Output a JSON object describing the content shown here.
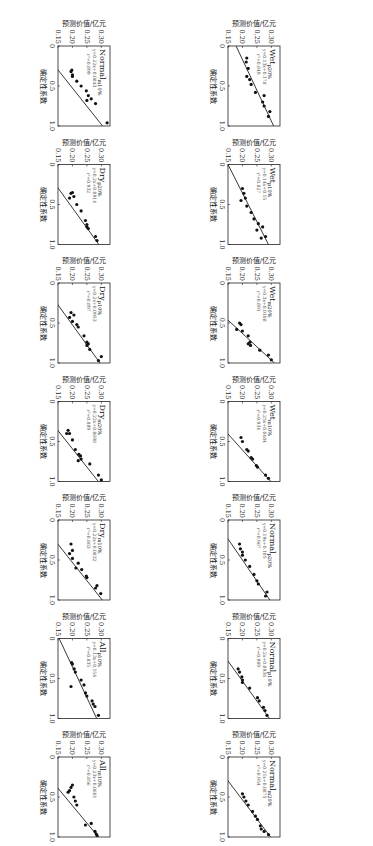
{
  "figure": {
    "xlabel": "确定性系数",
    "ylabel": "预测价值/亿元",
    "xticks": [
      "0",
      "0.5",
      "1.0"
    ],
    "yticks": [
      "0.15",
      "0.20",
      "0.25",
      "0.30"
    ]
  },
  "chart_data": [
    {
      "type": "scatter",
      "title": "Normal",
      "sub": "m10%",
      "equation": "y=0.22x+0.0843",
      "r2": "r²=0.899",
      "slope": 0.22,
      "intercept": 0.0843,
      "points": [
        [
          0.96,
          0.32
        ],
        [
          0.72,
          0.28
        ],
        [
          0.66,
          0.265
        ],
        [
          0.62,
          0.255
        ],
        [
          0.68,
          0.25
        ],
        [
          0.56,
          0.248
        ],
        [
          0.5,
          0.23
        ],
        [
          0.44,
          0.215
        ],
        [
          0.38,
          0.2
        ],
        [
          0.36,
          0.2
        ],
        [
          0.3,
          0.198
        ],
        [
          0.32,
          0.195
        ]
      ],
      "xlabel": "确定性系数",
      "ylabel": "预测价值/亿元",
      "xlim": [
        0,
        1
      ],
      "ylim": [
        0.15,
        0.33
      ]
    },
    {
      "type": "scatter",
      "title": "Dry",
      "sub": "p20%",
      "equation": "y=0.2x+0.0914",
      "r2": "r²=0.932",
      "slope": 0.2,
      "intercept": 0.0914,
      "points": [
        [
          0.95,
          0.285
        ],
        [
          0.9,
          0.28
        ],
        [
          0.8,
          0.255
        ],
        [
          0.75,
          0.25
        ],
        [
          0.78,
          0.25
        ],
        [
          0.7,
          0.245
        ],
        [
          0.58,
          0.23
        ],
        [
          0.5,
          0.215
        ],
        [
          0.4,
          0.205
        ],
        [
          0.35,
          0.2
        ],
        [
          0.36,
          0.195
        ],
        [
          0.42,
          0.19
        ]
      ],
      "xlabel": "确定性系数",
      "ylabel": "预测价值/亿元",
      "xlim": [
        0,
        1
      ],
      "ylim": [
        0.15,
        0.33
      ]
    },
    {
      "type": "scatter",
      "title": "Dry",
      "sub": "p10%",
      "equation": "y=0.2x+0.0953",
      "r2": "r²=0.897",
      "slope": 0.2,
      "intercept": 0.0953,
      "points": [
        [
          0.92,
          0.3
        ],
        [
          0.97,
          0.29
        ],
        [
          0.83,
          0.26
        ],
        [
          0.76,
          0.255
        ],
        [
          0.78,
          0.25
        ],
        [
          0.74,
          0.25
        ],
        [
          0.66,
          0.24
        ],
        [
          0.55,
          0.22
        ],
        [
          0.52,
          0.215
        ],
        [
          0.48,
          0.2
        ],
        [
          0.4,
          0.205
        ],
        [
          0.43,
          0.19
        ],
        [
          0.37,
          0.195
        ]
      ],
      "xlabel": "确定性系数",
      "ylabel": "预测价值/亿元",
      "xlim": [
        0,
        1
      ],
      "ylim": [
        0.15,
        0.33
      ]
    },
    {
      "type": "scatter",
      "title": "Dry",
      "sub": "m20%",
      "equation": "y=0.22x+0.0698",
      "r2": "r²=0.889",
      "slope": 0.22,
      "intercept": 0.0698,
      "points": [
        [
          0.98,
          0.3
        ],
        [
          0.92,
          0.29
        ],
        [
          0.78,
          0.26
        ],
        [
          0.72,
          0.23
        ],
        [
          0.68,
          0.228
        ],
        [
          0.66,
          0.222
        ],
        [
          0.74,
          0.22
        ],
        [
          0.6,
          0.21
        ],
        [
          0.48,
          0.2
        ],
        [
          0.4,
          0.19
        ],
        [
          0.36,
          0.185
        ],
        [
          0.4,
          0.18
        ]
      ],
      "xlabel": "确定性系数",
      "ylabel": "预测价值/亿元",
      "xlim": [
        0,
        1
      ],
      "ylim": [
        0.15,
        0.33
      ]
    },
    {
      "type": "scatter",
      "title": "Dry",
      "sub": "m10%",
      "equation": "y=0.22x+0.0832",
      "r2": "r²=0.863",
      "slope": 0.22,
      "intercept": 0.0832,
      "points": [
        [
          0.92,
          0.298
        ],
        [
          0.82,
          0.285
        ],
        [
          0.85,
          0.28
        ],
        [
          0.72,
          0.25
        ],
        [
          0.7,
          0.248
        ],
        [
          0.62,
          0.232
        ],
        [
          0.54,
          0.22
        ],
        [
          0.6,
          0.212
        ],
        [
          0.48,
          0.2
        ],
        [
          0.38,
          0.2
        ],
        [
          0.3,
          0.195
        ],
        [
          0.42,
          0.19
        ]
      ],
      "xlabel": "确定性系数",
      "ylabel": "预测价值/亿元",
      "xlim": [
        0,
        1
      ],
      "ylim": [
        0.15,
        0.33
      ]
    },
    {
      "type": "scatter",
      "title": "All",
      "sub": "p10%",
      "equation": "y=0.13x+0.154",
      "r2": "r²=0.835",
      "slope": 0.13,
      "intercept": 0.154,
      "points": [
        [
          0.96,
          0.29
        ],
        [
          0.85,
          0.278
        ],
        [
          0.82,
          0.272
        ],
        [
          0.78,
          0.268
        ],
        [
          0.72,
          0.25
        ],
        [
          0.68,
          0.245
        ],
        [
          0.58,
          0.24
        ],
        [
          0.52,
          0.23
        ],
        [
          0.42,
          0.21
        ],
        [
          0.38,
          0.206
        ],
        [
          0.32,
          0.2
        ],
        [
          0.3,
          0.197
        ],
        [
          0.6,
          0.195
        ]
      ],
      "xlabel": "确定性系数",
      "ylabel": "预测价值/亿元",
      "xlim": [
        0,
        1
      ],
      "ylim": [
        0.15,
        0.33
      ]
    },
    {
      "type": "scatter",
      "title": "All",
      "sub": "m10%",
      "equation": "y=0.23x+0.0601",
      "r2": "r²=0.856",
      "slope": 0.23,
      "intercept": 0.0601,
      "points": [
        [
          0.98,
          0.285
        ],
        [
          0.96,
          0.282
        ],
        [
          0.93,
          0.278
        ],
        [
          0.83,
          0.265
        ],
        [
          0.85,
          0.245
        ],
        [
          0.6,
          0.215
        ],
        [
          0.55,
          0.21
        ],
        [
          0.5,
          0.205
        ],
        [
          0.42,
          0.19
        ],
        [
          0.38,
          0.195
        ],
        [
          0.35,
          0.2
        ],
        [
          0.44,
          0.185
        ]
      ],
      "xlabel": "确定性系数",
      "ylabel": "预测价值/亿元",
      "xlim": [
        0,
        1
      ],
      "ylim": [
        0.15,
        0.33
      ]
    },
    {
      "type": "scatter",
      "title": "Wet",
      "sub": "p20%",
      "equation": "y=0.13x+0.178",
      "r2": "r²=0.849",
      "slope": 0.13,
      "intercept": 0.178,
      "points": [
        [
          0.82,
          0.295
        ],
        [
          0.88,
          0.29
        ],
        [
          0.75,
          0.275
        ],
        [
          0.62,
          0.275
        ],
        [
          0.7,
          0.27
        ],
        [
          0.58,
          0.245
        ],
        [
          0.48,
          0.23
        ],
        [
          0.42,
          0.225
        ],
        [
          0.38,
          0.215
        ],
        [
          0.28,
          0.22
        ],
        [
          0.2,
          0.213
        ],
        [
          0.15,
          0.215
        ]
      ],
      "xlabel": "确定性系数",
      "ylabel": "预测价值/亿元",
      "xlim": [
        0,
        1
      ],
      "ylim": [
        0.15,
        0.33
      ]
    },
    {
      "type": "scatter",
      "title": "Wet",
      "sub": "p10%",
      "equation": "y=0.14x+0.15",
      "r2": "r²=0.827",
      "slope": 0.14,
      "intercept": 0.15,
      "points": [
        [
          0.9,
          0.28
        ],
        [
          0.92,
          0.265
        ],
        [
          0.78,
          0.27
        ],
        [
          0.82,
          0.25
        ],
        [
          0.74,
          0.255
        ],
        [
          0.68,
          0.24
        ],
        [
          0.6,
          0.23
        ],
        [
          0.52,
          0.215
        ],
        [
          0.42,
          0.21
        ],
        [
          0.36,
          0.205
        ],
        [
          0.3,
          0.2
        ],
        [
          0.45,
          0.195
        ]
      ],
      "xlabel": "确定性系数",
      "ylabel": "预测价值/亿元",
      "xlim": [
        0,
        1
      ],
      "ylim": [
        0.15,
        0.33
      ]
    },
    {
      "type": "scatter",
      "title": "Wet",
      "sub": "m20%",
      "equation": "y=0.3x+0.0108",
      "r2": "r²=0.891",
      "slope": 0.3,
      "intercept": 0.0108,
      "points": [
        [
          0.96,
          0.3
        ],
        [
          0.9,
          0.29
        ],
        [
          0.84,
          0.26
        ],
        [
          0.78,
          0.228
        ],
        [
          0.74,
          0.226
        ],
        [
          0.76,
          0.22
        ],
        [
          0.66,
          0.22
        ],
        [
          0.6,
          0.2
        ],
        [
          0.52,
          0.195
        ],
        [
          0.5,
          0.19
        ],
        [
          0.58,
          0.18
        ]
      ],
      "xlabel": "确定性系数",
      "ylabel": "预测价值/亿元",
      "xlim": [
        0,
        1
      ],
      "ylim": [
        0.15,
        0.33
      ]
    },
    {
      "type": "scatter",
      "title": "Wet",
      "sub": "m10%",
      "equation": "y=0.25x+0.0484",
      "r2": "r²=0.934",
      "slope": 0.25,
      "intercept": 0.0484,
      "points": [
        [
          0.96,
          0.29
        ],
        [
          0.92,
          0.28
        ],
        [
          0.82,
          0.252
        ],
        [
          0.8,
          0.248
        ],
        [
          0.72,
          0.235
        ],
        [
          0.7,
          0.23
        ],
        [
          0.62,
          0.22
        ],
        [
          0.6,
          0.215
        ],
        [
          0.5,
          0.2
        ],
        [
          0.45,
          0.195
        ]
      ],
      "xlabel": "确定性系数",
      "ylabel": "预测价值/亿元",
      "xlim": [
        0,
        1
      ],
      "ylim": [
        0.15,
        0.33
      ]
    },
    {
      "type": "scatter",
      "title": "Normal",
      "sub": "p20%",
      "equation": "y=0.19x+0.105",
      "r2": "r²=0.967",
      "slope": 0.19,
      "intercept": 0.105,
      "points": [
        [
          0.9,
          0.285
        ],
        [
          0.95,
          0.28
        ],
        [
          0.8,
          0.255
        ],
        [
          0.76,
          0.25
        ],
        [
          0.68,
          0.24
        ],
        [
          0.58,
          0.225
        ],
        [
          0.5,
          0.21
        ],
        [
          0.44,
          0.2
        ],
        [
          0.4,
          0.2
        ],
        [
          0.36,
          0.193
        ],
        [
          0.3,
          0.19
        ]
      ],
      "xlabel": "确定性系数",
      "ylabel": "预测价值/亿元",
      "xlim": [
        0,
        1
      ],
      "ylim": [
        0.15,
        0.33
      ]
    },
    {
      "type": "scatter",
      "title": "Normal",
      "sub": "p10%",
      "equation": "y=0.2x+0.0936",
      "r2": "r²=0.909",
      "slope": 0.2,
      "intercept": 0.0936,
      "points": [
        [
          0.96,
          0.285
        ],
        [
          0.9,
          0.278
        ],
        [
          0.86,
          0.273
        ],
        [
          0.78,
          0.258
        ],
        [
          0.74,
          0.252
        ],
        [
          0.62,
          0.225
        ],
        [
          0.52,
          0.2
        ],
        [
          0.48,
          0.198
        ],
        [
          0.42,
          0.19
        ],
        [
          0.38,
          0.185
        ],
        [
          0.55,
          0.2
        ]
      ],
      "xlabel": "确定性系数",
      "ylabel": "预测价值/亿元",
      "xlim": [
        0,
        1
      ],
      "ylim": [
        0.15,
        0.33
      ]
    },
    {
      "type": "scatter",
      "title": "Normal",
      "sub": "m20%",
      "equation": "y=0.21x+0.0875",
      "r2": "r²=0.954",
      "slope": 0.21,
      "intercept": 0.0875,
      "points": [
        [
          0.97,
          0.29
        ],
        [
          0.93,
          0.275
        ],
        [
          0.9,
          0.265
        ],
        [
          0.86,
          0.262
        ],
        [
          0.78,
          0.252
        ],
        [
          0.74,
          0.245
        ],
        [
          0.68,
          0.235
        ],
        [
          0.6,
          0.22
        ],
        [
          0.55,
          0.212
        ],
        [
          0.5,
          0.205
        ],
        [
          0.46,
          0.2
        ]
      ],
      "xlabel": "确定性系数",
      "ylabel": "预测价值/亿元",
      "xlim": [
        0,
        1
      ],
      "ylim": [
        0.15,
        0.33
      ]
    }
  ],
  "layout_order": {
    "left_column_top_to_bottom": [
      0,
      1,
      2,
      3,
      4,
      5,
      6
    ],
    "right_column_top_to_bottom": [
      7,
      8,
      9,
      10,
      11,
      12,
      13
    ]
  }
}
